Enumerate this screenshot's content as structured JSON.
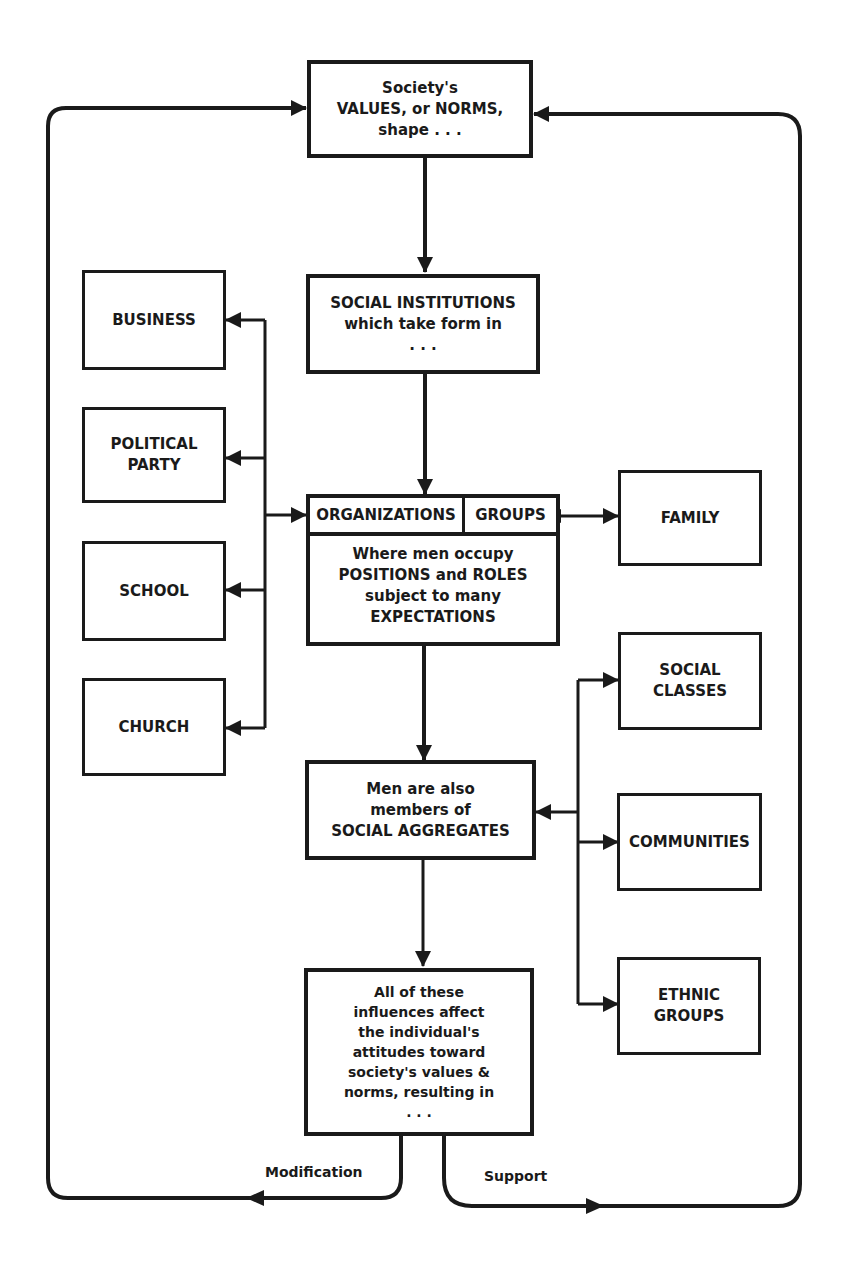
{
  "header": {
    "title_fragment": "... of societies."
  },
  "nodes": {
    "values": {
      "lines": [
        "Society's",
        "VALUES, or NORMS,",
        "shape . . ."
      ]
    },
    "institutions": {
      "lines": [
        "SOCIAL INSTITUTIONS",
        "which take form in",
        ". . ."
      ]
    },
    "orgs_groups": {
      "header_left": "ORGANIZATIONS",
      "header_right": "GROUPS",
      "lines": [
        "Where men occupy",
        "POSITIONS and ROLES",
        "subject to many",
        "EXPECTATIONS"
      ]
    },
    "aggregates": {
      "lines": [
        "Men are also",
        "members of",
        "SOCIAL AGGREGATES"
      ]
    },
    "influences": {
      "lines": [
        "All of these",
        "influences affect",
        "the individual's",
        "attitudes toward",
        "society's values &",
        "norms, resulting in",
        ". . ."
      ]
    },
    "business": {
      "lines": [
        "BUSINESS"
      ]
    },
    "political_party": {
      "lines": [
        "POLITICAL",
        "PARTY"
      ]
    },
    "school": {
      "lines": [
        "SCHOOL"
      ]
    },
    "church": {
      "lines": [
        "CHURCH"
      ]
    },
    "family": {
      "lines": [
        "FAMILY"
      ]
    },
    "social_classes": {
      "lines": [
        "SOCIAL",
        "CLASSES"
      ]
    },
    "communities": {
      "lines": [
        "COMMUNITIES"
      ]
    },
    "ethnic_groups": {
      "lines": [
        "ETHNIC",
        "GROUPS"
      ]
    }
  },
  "edges": {
    "modification_label": "Modification",
    "support_label": "Support"
  },
  "colors": {
    "ink": "#1a1a1a",
    "paper": "#ffffff"
  }
}
